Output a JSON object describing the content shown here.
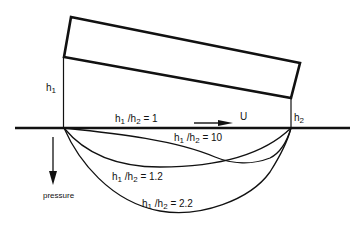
{
  "diagram": {
    "title": "",
    "labels": {
      "h1": {
        "base": "h",
        "sub": "1"
      },
      "h2": {
        "base": "h",
        "sub": "2"
      },
      "velocity": "U",
      "pressure_axis": "pressure"
    },
    "curves": [
      {
        "id": "ratio-1",
        "ratio_text": "= 1",
        "description": "h1/h2 = 1 (flat, zero pressure along baseline)"
      },
      {
        "id": "ratio-10",
        "ratio_text": "= 10"
      },
      {
        "id": "ratio-1-2",
        "ratio_text": "= 1.2"
      },
      {
        "id": "ratio-2-2",
        "ratio_text": "= 2.2"
      }
    ],
    "colors": {
      "line": "#111111",
      "background": "#ffffff"
    }
  }
}
